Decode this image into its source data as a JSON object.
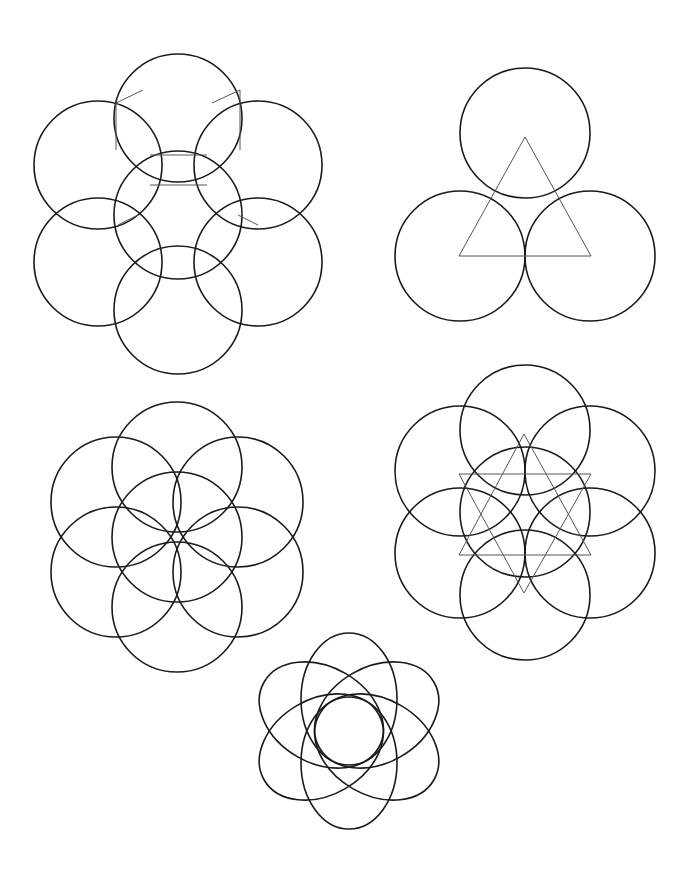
{
  "page": {
    "width": 696,
    "height": 879,
    "background": "#ffffff",
    "line_color": "#1a1a1a",
    "guide_color": "#555555"
  },
  "figures": [
    {
      "name": "seven-circle-flower-with-vesica-details",
      "circles": [
        {
          "cx": 178,
          "cy": 118,
          "r": 64
        },
        {
          "cx": 98,
          "cy": 165,
          "r": 64
        },
        {
          "cx": 258,
          "cy": 165,
          "r": 64
        },
        {
          "cx": 178,
          "cy": 215,
          "r": 64
        },
        {
          "cx": 98,
          "cy": 262,
          "r": 64
        },
        {
          "cx": 258,
          "cy": 262,
          "r": 64
        },
        {
          "cx": 178,
          "cy": 310,
          "r": 64
        }
      ],
      "guide_lines": [
        [
          116,
          103,
          143,
          90
        ],
        [
          116,
          103,
          116,
          150
        ],
        [
          240,
          90,
          212,
          103
        ],
        [
          240,
          90,
          240,
          150
        ],
        [
          150,
          155,
          207,
          155
        ],
        [
          150,
          185,
          207,
          185
        ],
        [
          118,
          225,
          138,
          215
        ],
        [
          238,
          215,
          258,
          225
        ]
      ]
    },
    {
      "name": "three-circles-with-triangle",
      "circles": [
        {
          "cx": 525,
          "cy": 133,
          "r": 65
        },
        {
          "cx": 460,
          "cy": 256,
          "r": 65
        },
        {
          "cx": 590,
          "cy": 256,
          "r": 65
        }
      ],
      "polygons": [
        [
          [
            525,
            137
          ],
          [
            459,
            256
          ],
          [
            591,
            256
          ]
        ]
      ]
    },
    {
      "name": "seed-of-life",
      "circles": [
        {
          "cx": 177,
          "cy": 537,
          "r": 65
        },
        {
          "cx": 177,
          "cy": 467,
          "r": 65
        },
        {
          "cx": 238,
          "cy": 502,
          "r": 65
        },
        {
          "cx": 238,
          "cy": 572,
          "r": 65
        },
        {
          "cx": 177,
          "cy": 607,
          "r": 65
        },
        {
          "cx": 116,
          "cy": 572,
          "r": 65
        },
        {
          "cx": 116,
          "cy": 502,
          "r": 65
        }
      ]
    },
    {
      "name": "seven-circles-with-star-of-david",
      "circles": [
        {
          "cx": 525,
          "cy": 430,
          "r": 65
        },
        {
          "cx": 460,
          "cy": 471,
          "r": 65
        },
        {
          "cx": 590,
          "cy": 471,
          "r": 65
        },
        {
          "cx": 525,
          "cy": 512,
          "r": 65
        },
        {
          "cx": 460,
          "cy": 553,
          "r": 65
        },
        {
          "cx": 590,
          "cy": 553,
          "r": 65
        },
        {
          "cx": 525,
          "cy": 595,
          "r": 65
        }
      ],
      "polygons": [
        [
          [
            524,
            434
          ],
          [
            459,
            555
          ],
          [
            591,
            555
          ]
        ],
        [
          [
            459,
            474
          ],
          [
            591,
            474
          ],
          [
            524,
            593
          ]
        ]
      ]
    },
    {
      "name": "ellipse-rosette",
      "center": {
        "cx": 349,
        "cy": 731
      },
      "ellipses": [
        {
          "offset": 32,
          "angle": 0,
          "rx": 48,
          "ry": 66
        },
        {
          "offset": 32,
          "angle": 60,
          "rx": 48,
          "ry": 66
        },
        {
          "offset": 32,
          "angle": 120,
          "rx": 48,
          "ry": 66
        },
        {
          "offset": 32,
          "angle": 180,
          "rx": 48,
          "ry": 66
        },
        {
          "offset": 32,
          "angle": 240,
          "rx": 48,
          "ry": 66
        },
        {
          "offset": 32,
          "angle": 300,
          "rx": 48,
          "ry": 66
        }
      ]
    }
  ]
}
